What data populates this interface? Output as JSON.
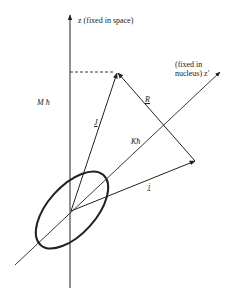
{
  "diagram": {
    "type": "vector-coupling",
    "colors": {
      "line": "#222222",
      "background": "#ffffff"
    },
    "labels": {
      "z_axis": "z (fixed in space)",
      "zprime_line1": "(fixed in",
      "zprime_line2": "nucleus) z′",
      "M_proj": "M ħ",
      "J_vec": "J",
      "R_vec": "R",
      "K_proj": "Kħ",
      "j_vec": "j"
    },
    "geometry": {
      "origin": [
        71,
        211
      ],
      "z_axis": {
        "from": [
          70,
          288
        ],
        "to": [
          70,
          14
        ]
      },
      "zprime_axis": {
        "from": [
          15,
          265
        ],
        "to": [
          220,
          72
        ]
      },
      "J_tip": [
        117,
        72
      ],
      "j_tip": [
        195,
        161
      ],
      "dashed_projection": {
        "from": [
          70,
          72
        ],
        "to": [
          117,
          72
        ]
      },
      "ellipse": {
        "cx": 72,
        "cy": 210,
        "rx": 47,
        "ry": 24,
        "rotate": -48
      }
    }
  }
}
